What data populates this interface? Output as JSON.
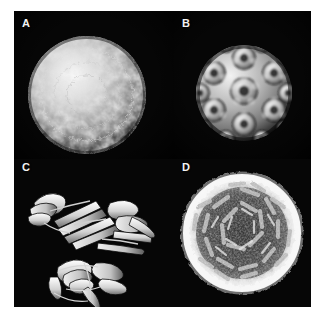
{
  "figure": {
    "background_color": "#ffffff",
    "plate_color": "#050505",
    "label_color": "#f2f2f2"
  },
  "panels": [
    {
      "id": "A",
      "label": "A",
      "content_kind": "surface-reconstruction-sphere",
      "description": "Rough granular icosahedral capsid surface reconstruction, full sphere",
      "shading": "grayscale",
      "highlight_color": "#e8e8e8",
      "midtone_color": "#9a9a9a",
      "shadow_color": "#2a2a2a"
    },
    {
      "id": "B",
      "label": "B",
      "content_kind": "smooth-capsomer-sphere",
      "description": "Smoothed capsid surface showing pentameric and hexameric capsomer rings",
      "shading": "grayscale",
      "highlight_color": "#dcdcdc",
      "midtone_color": "#8d8d8d",
      "shadow_color": "#1f1f1f"
    },
    {
      "id": "C",
      "label": "C",
      "content_kind": "ribbon-diagrams",
      "description": "Two protein subunit ribbon diagrams: an elongated beta-sheet arrangement above and a compact beta-barrel below",
      "shading": "white ribbons on black",
      "ribbon_color": "#f0f0f0",
      "ribbon_shadow_color": "#6a6a6a"
    },
    {
      "id": "D",
      "label": "D",
      "content_kind": "capsid-cross-section",
      "description": "Cross-section of the capsid with a bright knobby outer shell and a darker interior pinwheel arrangement of subunits",
      "shading": "grayscale",
      "shell_color": "#f4f4f4",
      "interior_color": "#8a8a8a",
      "cavity_color": "#101010"
    }
  ]
}
